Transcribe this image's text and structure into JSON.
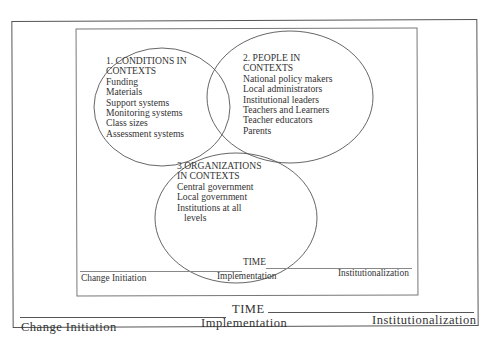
{
  "diagram": {
    "circles": [
      {
        "title_line1": "1. CONDITIONS IN",
        "title_line2": "CONTEXTS",
        "items": [
          "Funding",
          "Materials",
          "Support systems",
          "Monitoring systems",
          "Class sizes",
          "Assessment systems"
        ]
      },
      {
        "title_line1": "2. PEOPLE IN",
        "title_line2": "CONTEXTS",
        "items": [
          "National policy makers",
          "Local administrators",
          "Institutional leaders",
          "Teachers and Learners",
          "Teacher educators",
          "Parents"
        ]
      },
      {
        "title_line1": "3.ORGANIZATIONS",
        "title_line2": "IN CONTEXTS",
        "items": [
          "Central government",
          "Local government",
          "Institutions at all",
          "levels"
        ]
      }
    ],
    "inner_timeline": {
      "axis_label": "TIME",
      "stages": [
        "Change Initiation",
        "Implementation",
        "Institutionalization"
      ]
    },
    "outer_timeline": {
      "axis_label": "TIME",
      "stages": [
        "Change Initiation",
        "Implementation",
        "Institutionalization"
      ]
    }
  }
}
